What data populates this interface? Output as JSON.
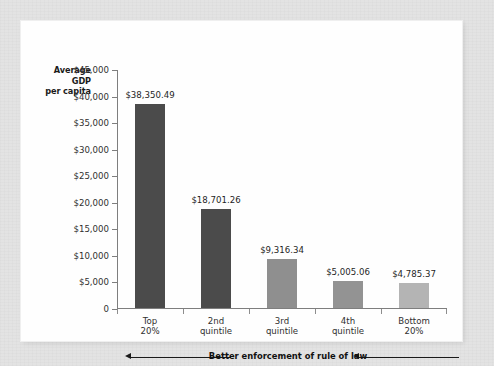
{
  "chart_data": {
    "type": "bar",
    "title": "",
    "xlabel": "Better enforcement of rule of law",
    "ylabel": "Average GDP per capita",
    "ylim": [
      0,
      45000
    ],
    "grid": false,
    "legend": "none",
    "categories": [
      "Top 20%",
      "2nd quintile",
      "3rd quintile",
      "4th quintile",
      "Bottom 20%"
    ],
    "values": [
      38350.49,
      18701.26,
      9316.34,
      5005.06,
      4785.37
    ],
    "data_labels": [
      "$38,350.49",
      "$18,701.26",
      "$9,316.34",
      "$5,005.06",
      "$4,785.37"
    ],
    "ytick_labels": [
      "$45,000",
      "$40,000",
      "$35,000",
      "$30,000",
      "$25,000",
      "$20,000",
      "$15,000",
      "$10,000",
      "$5,000",
      "0"
    ],
    "ytick_values": [
      45000,
      40000,
      35000,
      30000,
      25000,
      20000,
      15000,
      10000,
      5000,
      0
    ],
    "bar_colors": [
      "#4b4b4b",
      "#4b4b4b",
      "#8f8f8f",
      "#939393",
      "#b4b4b4"
    ],
    "annotation": {
      "text": "Better enforcement of rule of law",
      "arrow_direction": "left",
      "arrows": 2
    }
  },
  "axis": {
    "y_title_lines": [
      "Average",
      "GDP",
      "per capita"
    ]
  },
  "categories": [
    {
      "line1": "Top",
      "line2": "20%"
    },
    {
      "line1": "2nd",
      "line2": "quintile"
    },
    {
      "line1": "3rd",
      "line2": "quintile"
    },
    {
      "line1": "4th",
      "line2": "quintile"
    },
    {
      "line1": "Bottom",
      "line2": "20%"
    }
  ],
  "colors": {
    "page_background": "#e3e3e3",
    "panel_background": "#fefefe",
    "axis": "#7e7e7e",
    "text": "#30302f",
    "bar_dark": "#4b4b4b",
    "bar_mid": "#909090",
    "bar_light": "#b4b4b4"
  }
}
